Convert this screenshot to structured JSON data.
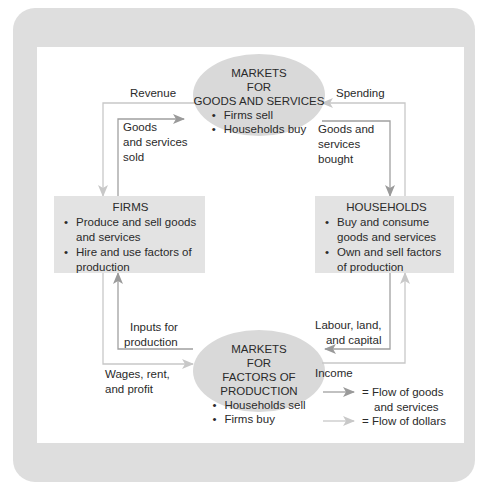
{
  "colors": {
    "panel_bg": "#dedede",
    "box_fill": "#e3e3e3",
    "ellipse_fill": "#d9d9d9",
    "goods_arrow": "#9a9a9a",
    "dollar_arrow": "#c4c4c4",
    "line": "#a8a8a8"
  },
  "goods_market": {
    "title_lines": [
      "MARKETS",
      "FOR",
      "GOODS AND SERVICES"
    ],
    "bullets": [
      "Firms sell",
      "Households buy"
    ]
  },
  "factor_market": {
    "title_lines": [
      "MARKETS",
      "FOR",
      "FACTORS OF PRODUCTION"
    ],
    "bullets": [
      "Households sell",
      "Firms buy"
    ]
  },
  "firms": {
    "title": "FIRMS",
    "bullets": [
      "Produce and sell goods and services",
      "Hire and use factors of production"
    ]
  },
  "households": {
    "title": "HOUSEHOLDS",
    "bullets": [
      "Buy and consume goods and services",
      "Own and sell factors of production"
    ]
  },
  "flow_labels": {
    "revenue": "Revenue",
    "spending": "Spending",
    "goods_sold": [
      "Goods",
      "and services",
      "sold"
    ],
    "goods_bought": [
      "Goods and",
      "services",
      "bought"
    ],
    "inputs": [
      "Inputs for",
      "production"
    ],
    "wages": [
      "Wages, rent,",
      "and profit"
    ],
    "labour": [
      "Labour, land,",
      "and capital"
    ],
    "income": "Income"
  },
  "legend": {
    "goods": [
      "= Flow of goods",
      "and services"
    ],
    "dollars": "= Flow of dollars"
  }
}
